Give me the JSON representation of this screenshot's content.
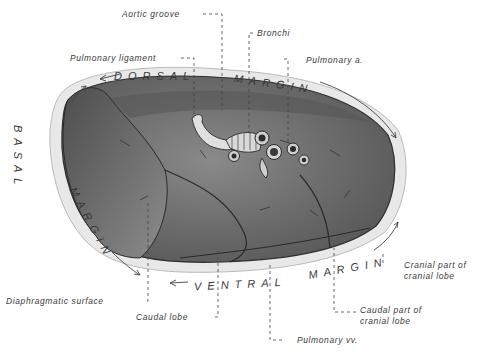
{
  "figure": {
    "colors": {
      "background": "#ffffff",
      "ink": "#3a3a3a",
      "tissue_dark": "#4a4a4a",
      "tissue_mid": "#7a7a7a",
      "tissue_light": "#bdbdbd",
      "pleura": "#e6e6e6"
    }
  },
  "labels": {
    "aortic_groove": "Aortic groove",
    "bronchi": "Bronchi",
    "pulmonary_ligament": "Pulmonary ligament",
    "pulmonary_a": "Pulmonary a.",
    "diaphragmatic_surface": "Diaphragmatic surface",
    "caudal_lobe": "Caudal lobe",
    "pulmonary_vv": "Pulmonary vv.",
    "cranial_part_line1": "Cranial part of",
    "cranial_part_line2": "cranial lobe",
    "caudal_part_line1": "Caudal part of",
    "caudal_part_line2": "cranial lobe"
  },
  "margins": {
    "dorsal": "DORSAL",
    "dorsal_margin": "MARGIN",
    "basal": "BASAL",
    "basal_margin": "MARGIN",
    "ventral": "VENTRAL",
    "ventral_margin": "MARGIN"
  }
}
